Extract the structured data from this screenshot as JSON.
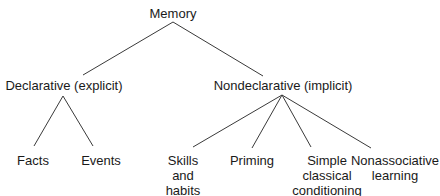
{
  "diagram": {
    "type": "tree",
    "root": {
      "label": "Memory",
      "children": [
        {
          "label": "Declarative (explicit)",
          "children": [
            {
              "label": "Facts"
            },
            {
              "label": "Events"
            }
          ]
        },
        {
          "label": "Nondeclarative (implicit)",
          "children": [
            {
              "label": "Skills\nand\nhabits",
              "lines": [
                "Skills",
                "and",
                "habits"
              ]
            },
            {
              "label": "Priming",
              "lines": [
                "Priming"
              ]
            },
            {
              "label": "Simple\nclassical\nconditioning",
              "lines": [
                "Simple",
                "classical",
                "conditioning"
              ]
            },
            {
              "label": "Nonassociative\nlearning",
              "lines": [
                "Nonassociative",
                "learning"
              ]
            }
          ]
        }
      ]
    },
    "colors": {
      "line": "#3a3a3a",
      "text": "#1a1a1a",
      "background": "#ffffff"
    }
  }
}
